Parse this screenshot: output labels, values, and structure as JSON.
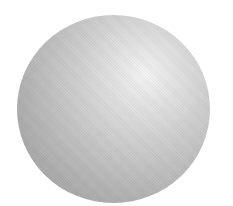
{
  "image": {
    "subject": "shaded-sphere",
    "background_color": "#ffffff",
    "sphere": {
      "highlight_color": "#f4f4f4",
      "midtone_color": "#c4c4c4",
      "shadow_color": "#9a9a9a",
      "highlight_position": "upper-right"
    }
  }
}
